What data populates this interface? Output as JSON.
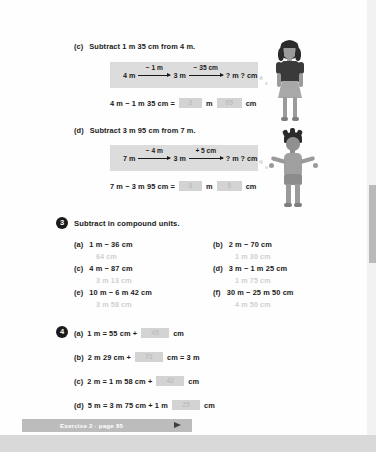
{
  "page": {
    "footer_note": "",
    "page_number": ""
  },
  "part_c": {
    "letter": "(c)",
    "prompt": "Subtract 1 m 35 cm from 4 m.",
    "numberline": {
      "start": "4 m",
      "step1_label": "− 1 m",
      "middle": "3 m",
      "step2_label": "− 35 cm",
      "end": "? m ? cm"
    },
    "equation_prefix": "4 m − 1 m 35 cm =",
    "answer_1": "2",
    "unit_1": "m",
    "answer_2": "65",
    "unit_2": "cm"
  },
  "part_d": {
    "letter": "(d)",
    "prompt": "Subtract 3 m 95 cm from 7 m.",
    "numberline": {
      "start": "7 m",
      "step1_label": "− 4 m",
      "middle": "3 m",
      "step2_label": "+ 5 cm",
      "end": "? m ? cm"
    },
    "equation_prefix": "7 m − 3 m 95 cm =",
    "answer_1": "3",
    "unit_1": "m",
    "answer_2": "5",
    "unit_2": "cm"
  },
  "section_3": {
    "number": "3",
    "title": "Subtract in compound units.",
    "items": [
      {
        "letter": "(a)",
        "problem": "1 m − 36 cm",
        "answer": "64 cm"
      },
      {
        "letter": "(b)",
        "problem": "2 m − 70 cm",
        "answer": "1 m 30 cm"
      },
      {
        "letter": "(c)",
        "problem": "4 m − 87 cm",
        "answer": "3 m 13 cm"
      },
      {
        "letter": "(d)",
        "problem": "3 m − 1 m 25 cm",
        "answer": "1 m 75 cm"
      },
      {
        "letter": "(e)",
        "problem": "10 m − 6 m 42 cm",
        "answer": "3 m 58 cm"
      },
      {
        "letter": "(f)",
        "problem": "30 m − 25 m 50 cm",
        "answer": "4 m 50 cm"
      }
    ]
  },
  "section_4": {
    "number": "4",
    "items": [
      {
        "letter": "(a)",
        "before": "1 m = 55 cm +",
        "answer": "45",
        "after": "cm"
      },
      {
        "letter": "(b)",
        "before": "2 m 29 cm +",
        "answer": "71",
        "after": "cm = 3 m"
      },
      {
        "letter": "(c)",
        "before": "2 m = 1 m 58 cm +",
        "answer": "42",
        "after": "cm"
      },
      {
        "letter": "(d)",
        "before": "5 m = 3 m 75 cm + 1 m",
        "answer": "25",
        "after": "cm"
      }
    ]
  },
  "banner": {
    "label": "Exercise 2 · page 85"
  }
}
